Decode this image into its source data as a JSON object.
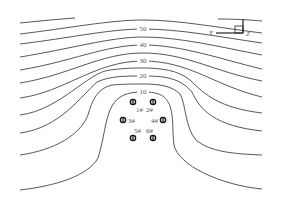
{
  "figure": {
    "contour_labels": [
      {
        "text": "50",
        "x": 143,
        "y": 31
      },
      {
        "text": "40",
        "x": 143,
        "y": 47
      },
      {
        "text": "30",
        "x": 143,
        "y": 63
      },
      {
        "text": "20",
        "x": 143,
        "y": 78
      },
      {
        "text": "10",
        "x": 143,
        "y": 94
      }
    ],
    "axes": {
      "y_label": "Y",
      "z_label": "Z"
    },
    "piles": [
      {
        "id": "1#",
        "x": 133,
        "y": 102,
        "label_x": 139,
        "label_y": 112
      },
      {
        "id": "2#",
        "x": 153,
        "y": 102,
        "label_x": 150,
        "label_y": 112
      },
      {
        "id": "3#",
        "x": 122,
        "y": 120,
        "label_x": 131,
        "label_y": 122
      },
      {
        "id": "4#",
        "x": 163,
        "y": 120,
        "label_x": 157,
        "label_y": 122
      },
      {
        "id": "5#",
        "x": 133,
        "y": 138,
        "label_x": 140,
        "label_y": 134
      },
      {
        "id": "6#",
        "x": 153,
        "y": 138,
        "label_x": 151,
        "label_y": 134
      }
    ]
  },
  "labels": {
    "c50": "50",
    "c40": "40",
    "c30": "30",
    "c20": "20",
    "c10": "10",
    "axis_y": "Y",
    "axis_z": "Z",
    "p1": "1#",
    "p2": "2#",
    "p3": "3#",
    "p4": "4#",
    "p5": "5#",
    "p6": "6#"
  }
}
